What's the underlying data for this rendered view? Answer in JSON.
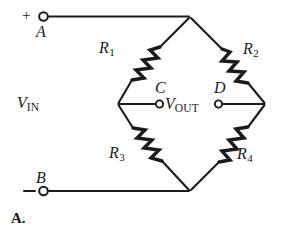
{
  "figure": {
    "caption": "A.",
    "type": "wheatstone-bridge-circuit"
  },
  "terminals": {
    "positive_sign": "+",
    "negative_sign": "−",
    "top_label": "A",
    "bottom_label": "B"
  },
  "source": {
    "input_v": "V",
    "input_sub": "IN"
  },
  "output": {
    "out_v": "V",
    "out_sub": "OUT",
    "node_left_label": "C",
    "node_right_label": "D"
  },
  "resistors": [
    {
      "name": "R",
      "sub": "1",
      "position": "upper-left"
    },
    {
      "name": "R",
      "sub": "2",
      "position": "upper-right"
    },
    {
      "name": "R",
      "sub": "3",
      "position": "lower-left"
    },
    {
      "name": "R",
      "sub": "4",
      "position": "lower-right"
    }
  ],
  "colors": {
    "ink": "#1a1a1a",
    "background": "#ffffff"
  },
  "geometry": {
    "top_node": "190,17",
    "left_node": "118,104",
    "right_node": "265,104",
    "bottom_node": "190,191",
    "terminal_a": "43,16",
    "terminal_b": "43,191",
    "node_c": "160,104",
    "node_d": "218,104"
  }
}
